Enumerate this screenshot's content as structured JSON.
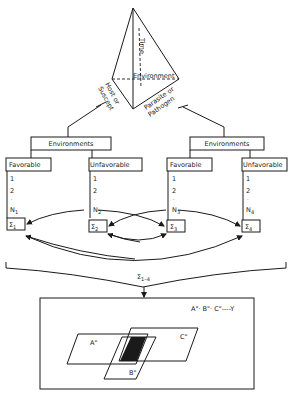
{
  "tetrahedron": {
    "labels": {
      "time": "Time",
      "environment": "Environment",
      "host": "Host or",
      "host2": "Suscept",
      "parasite": "Parasite or",
      "parasite2": "Pathogen"
    }
  },
  "branches": [
    {
      "header": "Environments",
      "columns": [
        {
          "label": "Favorable",
          "items": [
            "1",
            "2",
            "·",
            "N"
          ],
          "n_sub": "1",
          "sum": "Σ",
          "sum_sub": "1"
        },
        {
          "label": "Unfavorable",
          "items": [
            "1",
            "2",
            "·",
            "N"
          ],
          "n_sub": "2",
          "sum": "Σ",
          "sum_sub": "2"
        }
      ]
    },
    {
      "header": "Environments",
      "columns": [
        {
          "label": "Favorable",
          "items": [
            "1",
            "2",
            "·",
            "N"
          ],
          "n_sub": "3",
          "sum": "Σ",
          "sum_sub": "3"
        },
        {
          "label": "Unfavorable",
          "items": [
            "1",
            "2",
            "·",
            "N"
          ],
          "n_sub": "4",
          "sum": "Σ",
          "sum_sub": "4"
        }
      ]
    }
  ],
  "total": {
    "sum": "Σ",
    "sum_sub": "1–4"
  },
  "result": {
    "formula": "A\"· B\"· C\"----Y",
    "sets": [
      "A\"",
      "B\"",
      "C\""
    ]
  },
  "colors": {
    "ink": "#1a1a1a",
    "background": "#ffffff"
  }
}
